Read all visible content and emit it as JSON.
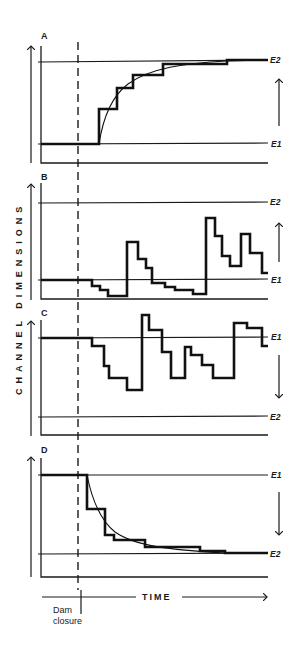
{
  "figure": {
    "y_axis_title": "CHANNEL DIMENSIONS",
    "x_axis_title": "TIME",
    "event_label_line1": "Dam",
    "event_label_line2": "closure",
    "colors": {
      "ink": "#1a1a1a",
      "background": "#ffffff"
    }
  },
  "panels": [
    {
      "id": "A",
      "label": "A",
      "upper_level": "E2",
      "lower_level": "E1",
      "trend": "increase to new equilibrium (smooth exponential with stepped response)"
    },
    {
      "id": "B",
      "label": "B",
      "upper_level": "E2",
      "lower_level": "E1",
      "trend": "fluctuating, episodic increases"
    },
    {
      "id": "C",
      "label": "C",
      "upper_level": "E1",
      "lower_level": "E2",
      "trend": "fluctuating, episodic decreases"
    },
    {
      "id": "D",
      "label": "D",
      "upper_level": "E1",
      "lower_level": "E2",
      "trend": "decrease to new equilibrium (smooth exponential with stepped response)"
    }
  ],
  "labels": {
    "A": "A",
    "B": "B",
    "C": "C",
    "D": "D",
    "A_top": "E2",
    "A_bottom": "E1",
    "B_top": "E2",
    "B_bottom": "E1",
    "C_top": "E1",
    "C_bottom": "E2",
    "D_top": "E1",
    "D_bottom": "E2"
  }
}
